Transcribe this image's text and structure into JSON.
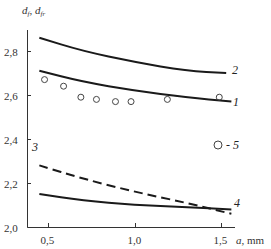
{
  "chart_data": {
    "type": "line",
    "title": "",
    "ylabel": "d_f, d_fr",
    "ylabel_main": "d",
    "ylabel_sub1": "f",
    "ylabel_sep": ", ",
    "ylabel_sub2": "fr",
    "xlabel": "a, mm",
    "xlabel_var": "a",
    "xlabel_unit": ", mm",
    "xlim": [
      0.35,
      1.62
    ],
    "ylim": [
      2.0,
      2.9
    ],
    "x_ticks": [
      "0,5",
      "1,0",
      "1,5"
    ],
    "x_tick_values": [
      0.5,
      1.0,
      1.5
    ],
    "y_ticks": [
      "2,0",
      "2,2",
      "2,4",
      "2,6",
      "2,8"
    ],
    "y_tick_values": [
      2.0,
      2.2,
      2.4,
      2.6,
      2.8
    ],
    "grid": false,
    "series": [
      {
        "name": "2",
        "style": "solid",
        "x": [
          0.45,
          0.7,
          1.0,
          1.3,
          1.53
        ],
        "y": [
          2.86,
          2.8,
          2.75,
          2.71,
          2.7
        ]
      },
      {
        "name": "1",
        "style": "solid",
        "x": [
          0.45,
          0.7,
          1.0,
          1.3,
          1.56
        ],
        "y": [
          2.71,
          2.66,
          2.62,
          2.59,
          2.57
        ]
      },
      {
        "name": "3",
        "style": "dashed",
        "x": [
          0.45,
          0.7,
          1.0,
          1.3,
          1.56
        ],
        "y": [
          2.28,
          2.22,
          2.16,
          2.11,
          2.06
        ]
      },
      {
        "name": "4",
        "style": "solid",
        "x": [
          0.45,
          0.7,
          1.0,
          1.3,
          1.56
        ],
        "y": [
          2.15,
          2.12,
          2.1,
          2.09,
          2.08
        ]
      },
      {
        "name": "5",
        "style": "markers",
        "marker": "open-circle",
        "x": [
          0.48,
          0.59,
          0.69,
          0.78,
          0.89,
          0.98,
          1.19,
          1.49
        ],
        "y": [
          2.67,
          2.64,
          2.59,
          2.58,
          2.57,
          2.57,
          2.58,
          2.59
        ]
      }
    ],
    "legend": [
      {
        "marker": "open-circle",
        "label": "- 5"
      }
    ],
    "annotations": [
      "1",
      "2",
      "3",
      "4"
    ]
  }
}
